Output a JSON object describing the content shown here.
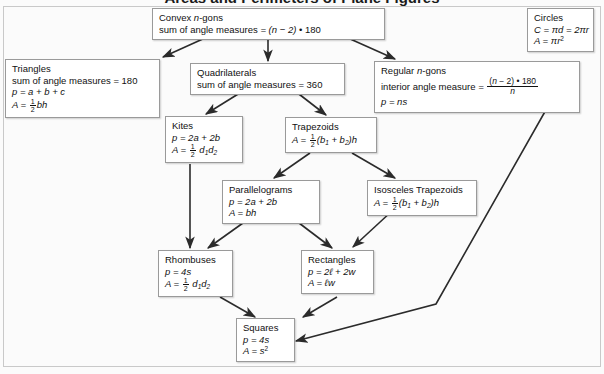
{
  "title": "Areas and Perimeters of Plane Figures",
  "colors": {
    "page_background": "#fbfbfb",
    "node_fill": "#ffffff",
    "node_border": "#9a9a9a",
    "arrow": "#2b2b2b",
    "text": "#111111"
  },
  "nodes": {
    "convex_ngons": {
      "title": "Convex n-gons",
      "lines": [
        "sum of angle measures = (n − 2) • 180"
      ]
    },
    "circles": {
      "title": "Circles",
      "lines": [
        "C = πd = 2πr",
        "A = πr²"
      ]
    },
    "triangles": {
      "title": "Triangles",
      "lines": [
        "sum of angle measures = 180",
        "p = a + b + c",
        "A = ½bh"
      ]
    },
    "quadrilaterals": {
      "title": "Quadrilaterals",
      "lines": [
        "sum of angle measures = 360"
      ]
    },
    "regular_ngons": {
      "title": "Regular n-gons",
      "lines": [
        "interior angle measure = (n − 2) • 180 / n",
        "p = ns"
      ]
    },
    "kites": {
      "title": "Kites",
      "lines": [
        "p = 2a + 2b",
        "A = ½ d₁d₂"
      ]
    },
    "trapezoids": {
      "title": "Trapezoids",
      "lines": [
        "A = ½(b₁ + b₂)h"
      ]
    },
    "parallelograms": {
      "title": "Parallelograms",
      "lines": [
        "p = 2a + 2b",
        "A = bh"
      ]
    },
    "isosceles_trapezoids": {
      "title": "Isosceles Trapezoids",
      "lines": [
        "A = ½(b₁ + b₂)h"
      ]
    },
    "rhombuses": {
      "title": "Rhombuses",
      "lines": [
        "p = 4s",
        "A = ½ d₁d₂"
      ]
    },
    "rectangles": {
      "title": "Rectangles",
      "lines": [
        "p = 2ℓ + 2w",
        "A = ℓw"
      ]
    },
    "squares": {
      "title": "Squares",
      "lines": [
        "p = 4s",
        "A = s²"
      ]
    }
  },
  "edges": [
    {
      "from": "convex_ngons",
      "to": "triangles"
    },
    {
      "from": "convex_ngons",
      "to": "quadrilaterals"
    },
    {
      "from": "convex_ngons",
      "to": "regular_ngons"
    },
    {
      "from": "quadrilaterals",
      "to": "kites"
    },
    {
      "from": "quadrilaterals",
      "to": "trapezoids"
    },
    {
      "from": "trapezoids",
      "to": "parallelograms"
    },
    {
      "from": "trapezoids",
      "to": "isosceles_trapezoids"
    },
    {
      "from": "kites",
      "to": "rhombuses"
    },
    {
      "from": "parallelograms",
      "to": "rhombuses"
    },
    {
      "from": "parallelograms",
      "to": "rectangles"
    },
    {
      "from": "isosceles_trapezoids",
      "to": "rectangles"
    },
    {
      "from": "rhombuses",
      "to": "squares"
    },
    {
      "from": "rectangles",
      "to": "squares"
    },
    {
      "from": "regular_ngons",
      "to": "squares"
    }
  ]
}
